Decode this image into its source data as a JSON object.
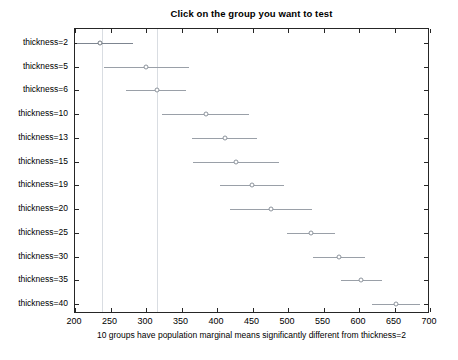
{
  "title": "Click on the group you want to test",
  "footnote": "10 groups have population marginal means significantly different from thickness=2",
  "colors": {
    "axis": "#262626",
    "line": "#9aa0a8",
    "selected_line": "#7d8590",
    "reference": "#d9dde2",
    "background": "#ffffff"
  },
  "chart_data": {
    "type": "scatter",
    "title": "Click on the group you want to test",
    "xlabel": "10 groups have population marginal means significantly different from thickness=2",
    "ylabel": "",
    "xlim": [
      200,
      700
    ],
    "ylim": [
      0,
      13
    ],
    "grid": false,
    "legend": null,
    "xticks": [
      200,
      250,
      300,
      350,
      400,
      450,
      500,
      550,
      600,
      650,
      700
    ],
    "xtick_labels": [
      "200",
      "250",
      "300",
      "350",
      "400",
      "450",
      "500",
      "550",
      "600",
      "650",
      "700"
    ],
    "categories": [
      "thickness=2",
      "thickness=5",
      "thickness=6",
      "thickness=10",
      "thickness=13",
      "thickness=15",
      "thickness=19",
      "thickness=20",
      "thickness=25",
      "thickness=30",
      "thickness=35",
      "thickness=40"
    ],
    "selected_group": "thickness=2",
    "reference_lines": [
      238,
      315
    ],
    "points": [
      {
        "group": "thickness=2",
        "mean": 235,
        "ci_low": 203,
        "ci_high": 281,
        "selected": true
      },
      {
        "group": "thickness=5",
        "mean": 300,
        "ci_low": 241,
        "ci_high": 360,
        "selected": false
      },
      {
        "group": "thickness=6",
        "mean": 315,
        "ci_low": 272,
        "ci_high": 357,
        "selected": false
      },
      {
        "group": "thickness=10",
        "mean": 384,
        "ci_low": 322,
        "ci_high": 445,
        "selected": false
      },
      {
        "group": "thickness=13",
        "mean": 411,
        "ci_low": 365,
        "ci_high": 456,
        "selected": false
      },
      {
        "group": "thickness=15",
        "mean": 427,
        "ci_low": 366,
        "ci_high": 488,
        "selected": false
      },
      {
        "group": "thickness=19",
        "mean": 449,
        "ci_low": 404,
        "ci_high": 494,
        "selected": false
      },
      {
        "group": "thickness=20",
        "mean": 476,
        "ci_low": 418,
        "ci_high": 534,
        "selected": false
      },
      {
        "group": "thickness=25",
        "mean": 532,
        "ci_low": 498,
        "ci_high": 566,
        "selected": false
      },
      {
        "group": "thickness=30",
        "mean": 572,
        "ci_low": 535,
        "ci_high": 609,
        "selected": false
      },
      {
        "group": "thickness=35",
        "mean": 603,
        "ci_low": 575,
        "ci_high": 632,
        "selected": false
      },
      {
        "group": "thickness=40",
        "mean": 652,
        "ci_low": 618,
        "ci_high": 686,
        "selected": false
      }
    ]
  }
}
